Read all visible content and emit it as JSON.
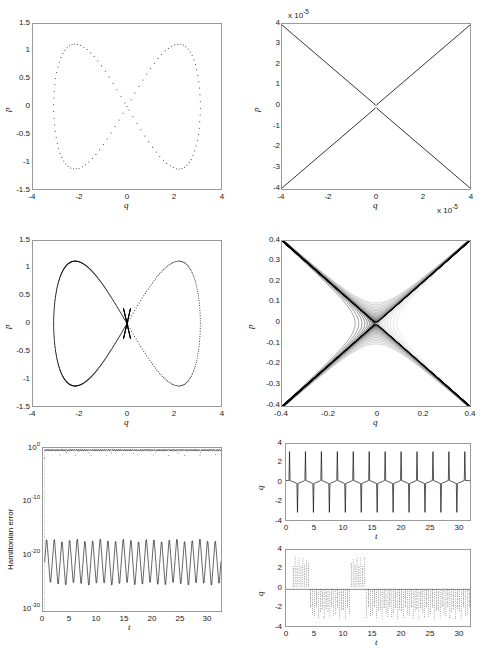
{
  "figure": {
    "title": "",
    "background": "#ffffff",
    "line_color": "#000000",
    "axis_color": "#9a9a9a",
    "layout": "2 columns x 3 rows of MATLAB subplots"
  },
  "chart_data": [
    {
      "id": "panel-top-left",
      "type": "scatter",
      "title": "",
      "xlabel": "q",
      "ylabel": "p",
      "xlim": [
        -4,
        4
      ],
      "ylim": [
        -1.5,
        1.5
      ],
      "xticks": [
        -4,
        -2,
        0,
        2,
        4
      ],
      "yticks": [
        -1.5,
        -1,
        -0.5,
        0,
        0.5,
        1,
        1.5
      ],
      "xticklabels": [
        "-4",
        "-2",
        "0",
        "2",
        "4"
      ],
      "yticklabels": [
        "-1.5",
        "-1",
        "-0.5",
        "0",
        "0.5",
        "1",
        "1.5"
      ],
      "grid": false,
      "marker": "dot",
      "description": "Figure-eight (lemniscate) phase portrait, dotted markers, symmetric about origin",
      "series": [
        {
          "name": "figure-eight orbit",
          "style": "dotted",
          "lobe_extent_q": [
            -3.1,
            3.1
          ],
          "lobe_extent_p": [
            -1.13,
            1.13
          ],
          "crossing_point": [
            0,
            0
          ]
        }
      ]
    },
    {
      "id": "panel-top-right",
      "type": "line",
      "title": "",
      "xlabel": "q",
      "ylabel": "p",
      "x_multiplier": "x 10^-5",
      "y_multiplier": "x 10^-5",
      "xlim": [
        -4,
        4
      ],
      "ylim": [
        -4,
        4
      ],
      "xticks": [
        -4,
        -2,
        0,
        2,
        4
      ],
      "yticks": [
        -4,
        -3,
        -2,
        -1,
        0,
        1,
        2,
        3,
        4
      ],
      "xticklabels": [
        "-4",
        "-2",
        "0",
        "2",
        "4"
      ],
      "yticklabels": [
        "-4",
        "-3",
        "-2",
        "-1",
        "0",
        "1",
        "2",
        "3",
        "4"
      ],
      "grid": false,
      "description": "Extreme zoom on the saddle crossing; two nearly straight hyperbola branches forming an X, units 1e-5",
      "series": [
        {
          "name": "upper branch",
          "style": "solid"
        },
        {
          "name": "lower branch",
          "style": "solid"
        }
      ]
    },
    {
      "id": "panel-mid-left",
      "type": "scatter",
      "title": "",
      "xlabel": "q",
      "ylabel": "p",
      "xlim": [
        -4,
        4
      ],
      "ylim": [
        -1.5,
        1.5
      ],
      "xticks": [
        -4,
        -2,
        0,
        2,
        4
      ],
      "yticks": [
        -1.5,
        -1,
        -0.5,
        0,
        0.5,
        1,
        1.5
      ],
      "xticklabels": [
        "-4",
        "-2",
        "0",
        "2",
        "4"
      ],
      "yticklabels": [
        "-1.5",
        "-1",
        "-0.5",
        "0",
        "0.5",
        "1",
        "1.5"
      ],
      "grid": false,
      "description": "Figure-eight phase portrait with dense (nearly solid) left lobe and sparse dotted right lobe; heavy point pile-up at the origin crossing",
      "series": [
        {
          "name": "left lobe (dense)",
          "style": "dense-dotted"
        },
        {
          "name": "right lobe (sparse)",
          "style": "sparse-dotted"
        }
      ]
    },
    {
      "id": "panel-mid-right",
      "type": "line",
      "title": "",
      "xlabel": "q",
      "ylabel": "p",
      "xlim": [
        -0.4,
        0.4
      ],
      "ylim": [
        -0.4,
        0.4
      ],
      "xticks": [
        -0.4,
        -0.2,
        0,
        0.2,
        0.4
      ],
      "yticks": [
        -0.4,
        -0.3,
        -0.2,
        -0.1,
        0,
        0.1,
        0.2,
        0.3,
        0.4
      ],
      "xticklabels": [
        "-0.4",
        "-0.2",
        "0",
        "0.2",
        "0.4"
      ],
      "yticklabels": [
        "-0.4",
        "-0.3",
        "-0.2",
        "-0.1",
        "0",
        "0.1",
        "0.2",
        "0.3",
        "0.4"
      ],
      "grid": false,
      "description": "Zoom on the saddle: a bundle of many hyperbolic passes forming an X; branches densest on the left arms, separatrix gap near the origin",
      "series": [
        {
          "name": "hyperbolic branch bundle",
          "style": "solid-multi",
          "count": 24
        }
      ]
    },
    {
      "id": "panel-bottom-left",
      "type": "line",
      "title": "",
      "xlabel": "t",
      "ylabel": "Hamiltonian error",
      "yscale": "log",
      "xlim": [
        0,
        31.4
      ],
      "ylim": [
        1e-30,
        1
      ],
      "xticks": [
        0,
        5,
        10,
        15,
        20,
        25,
        30
      ],
      "yticks": [
        "10^0",
        "10^-10",
        "10^-20",
        "10^-30"
      ],
      "xticklabels": [
        "0",
        "5",
        "10",
        "15",
        "20",
        "25",
        "30"
      ],
      "yticklabels": [
        "10",
        "10",
        "10",
        "10"
      ],
      "ytick_exponents": [
        "0",
        "-10",
        "-20",
        "-30"
      ],
      "grid": false,
      "description": "Two error traces on a log axis: a dotted trace hugging O(1) just below 1e0 with downward spikes, and a solid zig-zag trace oscillating between about 1e-25 and 1e-16",
      "series": [
        {
          "name": "non-symplectic error (dotted)",
          "style": "dotted",
          "level": 0.5,
          "range": [
            0.05,
            1
          ]
        },
        {
          "name": "symplectic error (solid)",
          "style": "solid",
          "range": [
            3e-26,
            1e-16
          ],
          "cycles": 23
        }
      ]
    },
    {
      "id": "panel-bottom-right-top",
      "type": "line",
      "title": "",
      "xlabel": "t",
      "ylabel": "q",
      "xlim": [
        0,
        31.4
      ],
      "ylim": [
        -4,
        4
      ],
      "xticks": [
        0,
        5,
        10,
        15,
        20,
        25,
        30
      ],
      "yticks": [
        -4,
        -2,
        0,
        2,
        4
      ],
      "xticklabels": [
        "0",
        "5",
        "10",
        "15",
        "20",
        "25",
        "30"
      ],
      "yticklabels": [
        "-4",
        "-2",
        "0",
        "2",
        "4"
      ],
      "grid": false,
      "description": "Regular spike train in q(t): sharp positive spikes to about +3.2 alternating with negative spikes to about -3.2, period roughly 2.7",
      "series": [
        {
          "name": "q(t)",
          "style": "solid",
          "spike_amplitude": 3.2,
          "period": 2.72
        }
      ]
    },
    {
      "id": "panel-bottom-right-bottom",
      "type": "line",
      "title": "",
      "xlabel": "t",
      "ylabel": "q",
      "xlim": [
        0,
        31.4
      ],
      "ylim": [
        -4,
        4
      ],
      "xticks": [
        0,
        5,
        10,
        15,
        20,
        25,
        30
      ],
      "yticks": [
        -4,
        -2,
        0,
        2,
        4
      ],
      "xticklabels": [
        "0",
        "5",
        "10",
        "15",
        "20",
        "25",
        "30"
      ],
      "yticklabels": [
        "-4",
        "-2",
        "0",
        "2",
        "4"
      ],
      "grid": false,
      "description": "Irregular dotted spike train in q(t): bursts of positive spikes near t=1-4 and t=11-13.5, long stretches of negative spikes elsewhere",
      "series": [
        {
          "name": "q(t) dotted",
          "style": "dotted",
          "spike_amplitude": 3.2,
          "positive_bursts": [
            [
              1,
              4
            ],
            [
              11,
              13.5
            ]
          ],
          "negative_regions": [
            [
              1,
              13.5
            ],
            [
              14,
              31.4
            ]
          ]
        }
      ]
    }
  ],
  "labels": {
    "q": "q",
    "p": "p",
    "t": "t",
    "hamiltonian_error": "Hamiltonian error",
    "exp_multiplier": "x 10",
    "exp_value": "-5"
  }
}
